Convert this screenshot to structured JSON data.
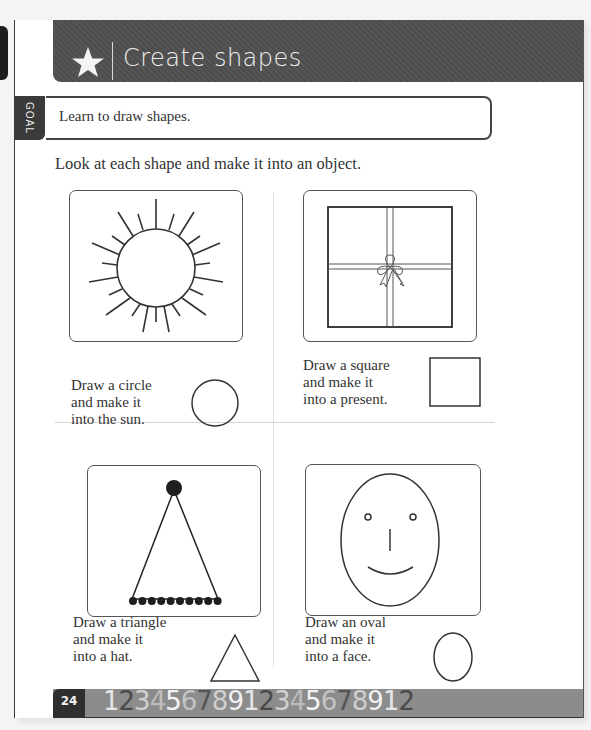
{
  "header": {
    "title": "Create shapes",
    "icon": "star-icon"
  },
  "goal": {
    "label": "GOAL",
    "text": "Learn to draw shapes."
  },
  "instruction": "Look at each shape and make it into an object.",
  "activities": [
    {
      "picture": "sun",
      "caption": "Draw a circle\nand make it\ninto the sun.",
      "shape": "circle"
    },
    {
      "picture": "present",
      "caption": "Draw a square\nand make it\ninto a present.",
      "shape": "square"
    },
    {
      "picture": "party-hat",
      "caption": "Draw a triangle\nand make it\ninto a hat.",
      "shape": "triangle"
    },
    {
      "picture": "face",
      "caption": "Draw an oval\nand make it\ninto a face.",
      "shape": "oval"
    }
  ],
  "footer": {
    "page_number": "24",
    "number_strip": [
      "1",
      "2",
      "3",
      "4",
      "5",
      "6",
      "7",
      "8",
      "9",
      "1",
      "2",
      "3",
      "4",
      "5",
      "6",
      "7",
      "8",
      "9",
      "1",
      "2"
    ],
    "number_colors": [
      "#e6e6e6",
      "#4a4a4a",
      "#d0d0d0",
      "#bcbcbc",
      "#f2f2f2",
      "#c4c4c4",
      "#555555",
      "#cfcfcf",
      "#f0f0f0",
      "#e6e6e6",
      "#4a4a4a",
      "#d0d0d0",
      "#bcbcbc",
      "#f2f2f2",
      "#c4c4c4",
      "#555555",
      "#cfcfcf",
      "#f0f0f0",
      "#e6e6e6",
      "#4a4a4a"
    ]
  },
  "colors": {
    "header_bg": "#505050",
    "footer_bg": "#8c8c8c",
    "page_num_bg": "#2e2e2e"
  }
}
